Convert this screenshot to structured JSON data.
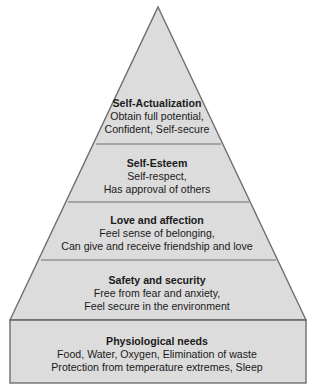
{
  "diagram": {
    "type": "pyramid",
    "colors": {
      "fill": "#dcdcdc",
      "stroke": "#6e6e6e",
      "text": "#1a1a1a"
    },
    "tiers": [
      {
        "title": "Self-Actualization",
        "lines": [
          "Obtain full potential,",
          "Confident, Self-secure"
        ]
      },
      {
        "title": "Self-Esteem",
        "lines": [
          "Self-respect,",
          "Has approval of others"
        ]
      },
      {
        "title": "Love and affection",
        "lines": [
          "Feel sense of belonging,",
          "Can give and receive friendship and love"
        ]
      },
      {
        "title": "Safety and security",
        "lines": [
          "Free from fear and anxiety,",
          "Feel secure in the environment"
        ]
      },
      {
        "title": "Physiological needs",
        "lines": [
          "Food, Water, Oxygen, Elimination of waste",
          "Protection from temperature extremes, Sleep"
        ]
      }
    ]
  }
}
